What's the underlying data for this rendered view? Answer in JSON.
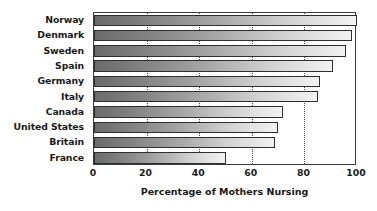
{
  "chart_data": {
    "type": "bar",
    "orientation": "horizontal",
    "title": "",
    "xlabel": "Percentage of Mothers Nursing",
    "ylabel": "",
    "categories": [
      "Norway",
      "Denmark",
      "Sweden",
      "Spain",
      "Germany",
      "Italy",
      "Canada",
      "United States",
      "Britain",
      "France"
    ],
    "values": [
      100,
      98,
      96,
      91,
      86,
      85,
      72,
      70,
      69,
      50
    ],
    "xlim": [
      0,
      100
    ],
    "xticks": [
      0,
      20,
      40,
      60,
      80,
      100
    ],
    "xtick_labels": [
      "0",
      "20",
      "40",
      "60",
      "80",
      "100"
    ],
    "gridlines": {
      "vertical_at": [
        20,
        40,
        60,
        80
      ],
      "style": "dotted",
      "color": "#4a4a4a"
    },
    "legend": null,
    "bar_style": {
      "gradient_start_color": "#6b6b6b",
      "gradient_end_color": "#f2f2f2",
      "border_color": "#2f2f2f"
    },
    "frame_color": "#3b3b3b",
    "background_color": "#ffffff",
    "text_color": "#1a1a1a"
  }
}
